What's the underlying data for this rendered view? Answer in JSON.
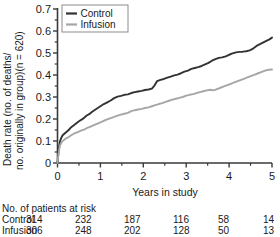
{
  "chart_data": {
    "type": "line",
    "title": "",
    "xlabel": "Years in study",
    "ylabel_line1": "Death rate (no. of deaths/",
    "ylabel_line2": "no. originally in group)(n = 620)",
    "ylabel_full": "Death rate (no. of deaths/no. originally in group)(n = 620)",
    "xlim": [
      0,
      5
    ],
    "ylim": [
      0,
      0.7
    ],
    "xticks": [
      0,
      1,
      2,
      3,
      4,
      5
    ],
    "xtick_labels": [
      "0",
      "1",
      "2",
      "3",
      "4",
      "5"
    ],
    "xminor_ticks": [
      0.5,
      1.5,
      2.5,
      3.5,
      4.5
    ],
    "yticks": [
      0,
      0.1,
      0.2,
      0.3,
      0.4,
      0.5,
      0.6,
      0.7
    ],
    "ytick_labels": [
      "0",
      "0.1",
      "0.2",
      "0.3",
      "0.4",
      "0.5",
      "0.6",
      "0.7"
    ],
    "yminor_ticks": [
      0.05,
      0.15,
      0.25,
      0.35,
      0.45,
      0.55,
      0.65
    ],
    "grid": false,
    "legend_position": "top-left",
    "series": [
      {
        "name": "Control",
        "color": "#333333",
        "points": [
          [
            0.0,
            0.0
          ],
          [
            0.02,
            0.045
          ],
          [
            0.04,
            0.078
          ],
          [
            0.06,
            0.1
          ],
          [
            0.09,
            0.115
          ],
          [
            0.12,
            0.126
          ],
          [
            0.16,
            0.133
          ],
          [
            0.2,
            0.14
          ],
          [
            0.26,
            0.15
          ],
          [
            0.32,
            0.163
          ],
          [
            0.38,
            0.172
          ],
          [
            0.44,
            0.181
          ],
          [
            0.5,
            0.19
          ],
          [
            0.56,
            0.197
          ],
          [
            0.62,
            0.205
          ],
          [
            0.68,
            0.216
          ],
          [
            0.74,
            0.222
          ],
          [
            0.8,
            0.232
          ],
          [
            0.86,
            0.24
          ],
          [
            0.92,
            0.248
          ],
          [
            1.0,
            0.258
          ],
          [
            1.08,
            0.268
          ],
          [
            1.16,
            0.276
          ],
          [
            1.24,
            0.284
          ],
          [
            1.32,
            0.295
          ],
          [
            1.4,
            0.302
          ],
          [
            1.48,
            0.305
          ],
          [
            1.56,
            0.31
          ],
          [
            1.64,
            0.312
          ],
          [
            1.72,
            0.318
          ],
          [
            1.8,
            0.322
          ],
          [
            1.88,
            0.325
          ],
          [
            1.96,
            0.328
          ],
          [
            2.04,
            0.332
          ],
          [
            2.12,
            0.334
          ],
          [
            2.2,
            0.338
          ],
          [
            2.26,
            0.352
          ],
          [
            2.32,
            0.372
          ],
          [
            2.4,
            0.378
          ],
          [
            2.48,
            0.382
          ],
          [
            2.56,
            0.388
          ],
          [
            2.64,
            0.393
          ],
          [
            2.72,
            0.398
          ],
          [
            2.8,
            0.402
          ],
          [
            2.88,
            0.408
          ],
          [
            2.96,
            0.415
          ],
          [
            3.04,
            0.42
          ],
          [
            3.12,
            0.428
          ],
          [
            3.2,
            0.432
          ],
          [
            3.28,
            0.436
          ],
          [
            3.36,
            0.441
          ],
          [
            3.44,
            0.448
          ],
          [
            3.52,
            0.455
          ],
          [
            3.6,
            0.465
          ],
          [
            3.68,
            0.472
          ],
          [
            3.76,
            0.478
          ],
          [
            3.84,
            0.48
          ],
          [
            3.92,
            0.485
          ],
          [
            4.0,
            0.492
          ],
          [
            4.08,
            0.498
          ],
          [
            4.16,
            0.503
          ],
          [
            4.24,
            0.505
          ],
          [
            4.32,
            0.506
          ],
          [
            4.4,
            0.508
          ],
          [
            4.48,
            0.512
          ],
          [
            4.56,
            0.52
          ],
          [
            4.64,
            0.532
          ],
          [
            4.72,
            0.54
          ],
          [
            4.8,
            0.548
          ],
          [
            4.88,
            0.556
          ],
          [
            4.94,
            0.562
          ],
          [
            5.0,
            0.57
          ]
        ]
      },
      {
        "name": "Infusion",
        "color": "#a6a6a6",
        "points": [
          [
            0.0,
            0.0
          ],
          [
            0.02,
            0.035
          ],
          [
            0.04,
            0.062
          ],
          [
            0.06,
            0.08
          ],
          [
            0.09,
            0.092
          ],
          [
            0.12,
            0.1
          ],
          [
            0.16,
            0.106
          ],
          [
            0.2,
            0.112
          ],
          [
            0.26,
            0.118
          ],
          [
            0.32,
            0.126
          ],
          [
            0.38,
            0.133
          ],
          [
            0.44,
            0.138
          ],
          [
            0.5,
            0.143
          ],
          [
            0.56,
            0.148
          ],
          [
            0.62,
            0.152
          ],
          [
            0.68,
            0.158
          ],
          [
            0.74,
            0.163
          ],
          [
            0.8,
            0.168
          ],
          [
            0.86,
            0.173
          ],
          [
            0.92,
            0.178
          ],
          [
            1.0,
            0.185
          ],
          [
            1.08,
            0.192
          ],
          [
            1.16,
            0.198
          ],
          [
            1.24,
            0.204
          ],
          [
            1.32,
            0.21
          ],
          [
            1.4,
            0.215
          ],
          [
            1.48,
            0.22
          ],
          [
            1.56,
            0.224
          ],
          [
            1.64,
            0.228
          ],
          [
            1.72,
            0.236
          ],
          [
            1.8,
            0.24
          ],
          [
            1.88,
            0.243
          ],
          [
            1.96,
            0.246
          ],
          [
            2.04,
            0.25
          ],
          [
            2.12,
            0.253
          ],
          [
            2.2,
            0.258
          ],
          [
            2.28,
            0.263
          ],
          [
            2.36,
            0.268
          ],
          [
            2.44,
            0.272
          ],
          [
            2.52,
            0.278
          ],
          [
            2.6,
            0.283
          ],
          [
            2.68,
            0.288
          ],
          [
            2.76,
            0.292
          ],
          [
            2.84,
            0.296
          ],
          [
            2.92,
            0.3
          ],
          [
            3.0,
            0.306
          ],
          [
            3.08,
            0.31
          ],
          [
            3.16,
            0.313
          ],
          [
            3.24,
            0.318
          ],
          [
            3.32,
            0.322
          ],
          [
            3.4,
            0.326
          ],
          [
            3.48,
            0.33
          ],
          [
            3.56,
            0.333
          ],
          [
            3.64,
            0.33
          ],
          [
            3.72,
            0.336
          ],
          [
            3.8,
            0.342
          ],
          [
            3.88,
            0.348
          ],
          [
            3.96,
            0.354
          ],
          [
            4.04,
            0.36
          ],
          [
            4.12,
            0.366
          ],
          [
            4.2,
            0.372
          ],
          [
            4.28,
            0.378
          ],
          [
            4.36,
            0.384
          ],
          [
            4.44,
            0.39
          ],
          [
            4.52,
            0.396
          ],
          [
            4.6,
            0.402
          ],
          [
            4.68,
            0.408
          ],
          [
            4.76,
            0.414
          ],
          [
            4.84,
            0.42
          ],
          [
            4.92,
            0.424
          ],
          [
            5.0,
            0.425
          ]
        ]
      }
    ]
  },
  "legend": {
    "items": [
      {
        "label": "Control",
        "color": "#333333"
      },
      {
        "label": "Infusion",
        "color": "#a6a6a6"
      }
    ]
  },
  "risk_table": {
    "caption": "No. of patients at risk",
    "column_positions": [
      0,
      1,
      2,
      3,
      4,
      5
    ],
    "rows": [
      {
        "label": "Control",
        "values": [
          "314",
          "232",
          "187",
          "116",
          "58",
          "14"
        ]
      },
      {
        "label": "Infusion",
        "values": [
          "306",
          "248",
          "202",
          "128",
          "50",
          "13"
        ]
      }
    ]
  },
  "colors": {
    "axis": "#3a3a3a",
    "control": "#333333",
    "infusion": "#a6a6a6",
    "text": "#1a1a1a",
    "legend_border": "#8c8c8c",
    "background": "#ffffff"
  }
}
